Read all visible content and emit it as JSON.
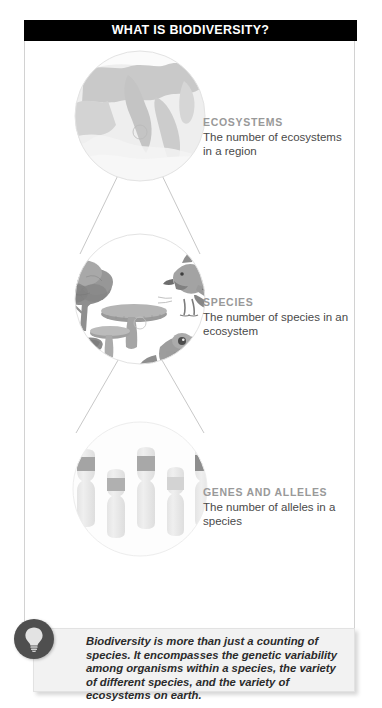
{
  "header": {
    "title": "WHAT IS BIODIVERSITY?"
  },
  "levels": [
    {
      "kicker": "ECOSYSTEMS",
      "description": "The number of ecosystems in a region",
      "illustration": "map-landscape-circle"
    },
    {
      "kicker": "SPECIES",
      "description": "The number of species in an ecosystem",
      "illustration": "organisms-tree-bird-mushroom-bee-frog-circle"
    },
    {
      "kicker": "GENES AND ALLELES",
      "description": "The number of alleles in a species",
      "illustration": "chromosomes-circle"
    }
  ],
  "caption": {
    "icon": "lightbulb-icon",
    "text": "Biodiversity is more than just a counting of species. It encompasses the genetic variability among organisms within a species, the variety of different species, and the variety of ecosystems on earth."
  },
  "colors": {
    "banner_background": "#000000",
    "banner_text": "#ffffff",
    "kicker_text": "#999999",
    "body_text": "#4a4a4a",
    "panel_border": "#d2d2d2",
    "caption_background": "#f2f2f2",
    "badge_background": "#4f4f4f"
  }
}
